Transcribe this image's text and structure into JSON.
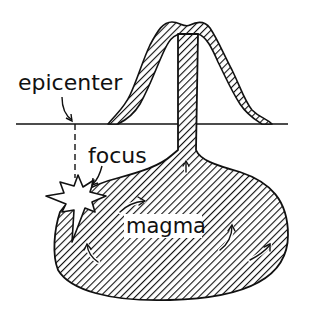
{
  "diagram": {
    "labels": {
      "epicenter": "epicenter",
      "focus": "focus",
      "magma": "magma"
    },
    "colors": {
      "ink": "#111111",
      "background": "#ffffff",
      "hatch": "#111111"
    }
  }
}
